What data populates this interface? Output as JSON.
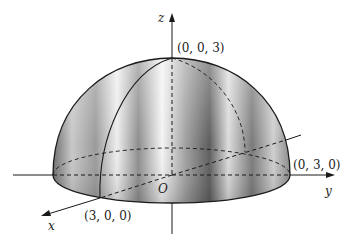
{
  "diagram": {
    "axes": {
      "x_label": "x",
      "y_label": "y",
      "z_label": "z",
      "origin_label": "O"
    },
    "points": {
      "x_intercept": "(3, 0, 0)",
      "y_intercept": "(0, 3, 0)",
      "z_top": "(0, 0, 3)"
    },
    "colors": {
      "line": "#1a1a1a",
      "surface_dark": "#5a5a5a",
      "surface_light": "#f2f2f2"
    }
  }
}
